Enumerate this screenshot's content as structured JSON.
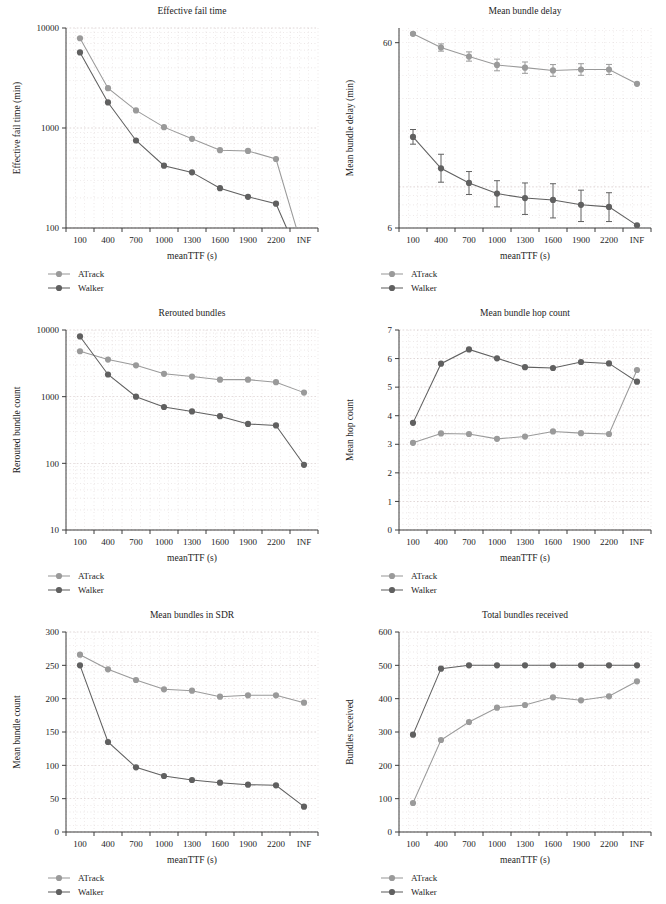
{
  "figure": {
    "background": "#ffffff",
    "columns": 2,
    "rows": 3
  },
  "style": {
    "color_atrack": "#9a9a9a",
    "color_walker": "#606060",
    "color_axis": "#3d3d3d",
    "color_grid": "#c9b8b8",
    "color_text": "#1d1d1d"
  },
  "legend": {
    "entries": [
      {
        "label": "ATrack",
        "color": "#9a9a9a",
        "marker": "filled-circle"
      },
      {
        "label": "Walker",
        "color": "#606060",
        "marker": "filled-circle"
      }
    ]
  },
  "shared": {
    "xlabel": "meanTTF (s)",
    "xticklabels": [
      "100",
      "400",
      "700",
      "1000",
      "1300",
      "1600",
      "1900",
      "2200",
      "INF"
    ]
  },
  "chart_data": [
    {
      "id": "effective-fail-time",
      "type": "line",
      "title": "Effective fail time",
      "xlabel": "meanTTF (s)",
      "ylabel": "Effective fail time (min)",
      "categories": [
        "100",
        "400",
        "700",
        "1000",
        "1300",
        "1600",
        "1900",
        "2200",
        "INF"
      ],
      "yscale": "log",
      "ylim": [
        100,
        10000
      ],
      "yticklabels": [
        "100",
        "1000",
        "10000"
      ],
      "ytickvalues": [
        100,
        1000,
        10000
      ],
      "grid": true,
      "legend_position": "below-left",
      "series": [
        {
          "name": "ATrack",
          "color": "#9a9a9a",
          "values": [
            7900,
            2500,
            1500,
            1020,
            780,
            600,
            590,
            490,
            55
          ]
        },
        {
          "name": "Walker",
          "color": "#606060",
          "values": [
            5700,
            1800,
            750,
            420,
            360,
            250,
            205,
            175,
            40
          ]
        }
      ],
      "notes": "Both series fall below the plotted 100 minimum at INF, so the final segments run off the bottom of the axes."
    },
    {
      "id": "mean-bundle-delay",
      "type": "line",
      "title": "Mean bundle delay",
      "xlabel": "meanTTF (s)",
      "ylabel": "Mean bundle delay (min)",
      "categories": [
        "100",
        "400",
        "700",
        "1000",
        "1300",
        "1600",
        "1900",
        "2200",
        "INF"
      ],
      "yscale": "log",
      "ylim": [
        6,
        72
      ],
      "yticklabels": [
        "6",
        "60"
      ],
      "ytickvalues": [
        6,
        60
      ],
      "grid": true,
      "legend_position": "below-left",
      "errorbars": true,
      "series": [
        {
          "name": "ATrack",
          "color": "#9a9a9a",
          "values": [
            67.0,
            56.5,
            50.5,
            45.5,
            44.0,
            42.5,
            43.0,
            43.0,
            36.0
          ],
          "err_low": [
            1.0,
            2.5,
            2.8,
            3.2,
            3.0,
            3.0,
            3.0,
            2.6,
            0.0
          ],
          "err_high": [
            1.0,
            2.6,
            3.0,
            3.4,
            3.2,
            3.2,
            3.2,
            2.8,
            0.0
          ]
        },
        {
          "name": "Walker",
          "color": "#606060",
          "values": [
            18.6,
            12.6,
            10.5,
            9.2,
            8.7,
            8.5,
            8.0,
            7.8,
            6.2
          ],
          "err_low": [
            1.6,
            2.0,
            1.4,
            1.4,
            1.6,
            1.7,
            1.5,
            1.3,
            0.0
          ],
          "err_high": [
            1.8,
            2.4,
            1.6,
            1.6,
            1.8,
            1.9,
            1.6,
            1.5,
            0.0
          ]
        }
      ]
    },
    {
      "id": "rerouted-bundles",
      "type": "line",
      "title": "Rerouted bundles",
      "xlabel": "meanTTF (s)",
      "ylabel": "Rerouted bundle count",
      "categories": [
        "100",
        "400",
        "700",
        "1000",
        "1300",
        "1600",
        "1900",
        "2200",
        "INF"
      ],
      "yscale": "log",
      "ylim": [
        10,
        10000
      ],
      "yticklabels": [
        "10",
        "100",
        "1000",
        "10000"
      ],
      "ytickvalues": [
        10,
        100,
        1000,
        10000
      ],
      "grid": true,
      "legend_position": "below-left",
      "series": [
        {
          "name": "ATrack",
          "color": "#9a9a9a",
          "values": [
            4800,
            3600,
            2950,
            2200,
            2000,
            1800,
            1800,
            1650,
            1150
          ]
        },
        {
          "name": "Walker",
          "color": "#606060",
          "values": [
            8000,
            2150,
            1000,
            700,
            600,
            510,
            390,
            370,
            95
          ]
        }
      ]
    },
    {
      "id": "mean-bundle-hop-count",
      "type": "line",
      "title": "Mean bundle hop count",
      "xlabel": "meanTTF (s)",
      "ylabel": "Mean hop count",
      "categories": [
        "100",
        "400",
        "700",
        "1000",
        "1300",
        "1600",
        "1900",
        "2200",
        "INF"
      ],
      "yscale": "linear",
      "ylim": [
        0,
        7
      ],
      "yticklabels": [
        "0",
        "1",
        "2",
        "3",
        "4",
        "5",
        "6",
        "7"
      ],
      "ytickvalues": [
        0,
        1,
        2,
        3,
        4,
        5,
        6,
        7
      ],
      "grid": true,
      "legend_position": "below-left",
      "series": [
        {
          "name": "ATrack",
          "color": "#9a9a9a",
          "values": [
            3.05,
            3.38,
            3.36,
            3.19,
            3.27,
            3.45,
            3.39,
            3.36,
            5.6
          ]
        },
        {
          "name": "Walker",
          "color": "#606060",
          "values": [
            3.75,
            5.82,
            6.32,
            6.01,
            5.7,
            5.67,
            5.88,
            5.83,
            5.19
          ]
        }
      ]
    },
    {
      "id": "mean-bundles-in-sdr",
      "type": "line",
      "title": "Mean bundles in SDR",
      "xlabel": "meanTTF (s)",
      "ylabel": "Mean bundle count",
      "categories": [
        "100",
        "400",
        "700",
        "1000",
        "1300",
        "1600",
        "1900",
        "2200",
        "INF"
      ],
      "yscale": "linear",
      "ylim": [
        0,
        300
      ],
      "yticklabels": [
        "0",
        "50",
        "100",
        "150",
        "200",
        "250",
        "300"
      ],
      "ytickvalues": [
        0,
        50,
        100,
        150,
        200,
        250,
        300
      ],
      "grid": true,
      "legend_position": "below-left",
      "series": [
        {
          "name": "ATrack",
          "color": "#9a9a9a",
          "values": [
            266,
            244,
            228,
            214,
            212,
            203,
            205,
            205,
            194
          ]
        },
        {
          "name": "Walker",
          "color": "#606060",
          "values": [
            250,
            135,
            97,
            84,
            78,
            74,
            71,
            70,
            38
          ]
        }
      ]
    },
    {
      "id": "total-bundles-received",
      "type": "line",
      "title": "Total bundles received",
      "xlabel": "meanTTF (s)",
      "ylabel": "Bundles received",
      "categories": [
        "100",
        "400",
        "700",
        "1000",
        "1300",
        "1600",
        "1900",
        "2200",
        "INF"
      ],
      "yscale": "linear",
      "ylim": [
        0,
        600
      ],
      "yticklabels": [
        "0",
        "100",
        "200",
        "300",
        "400",
        "500",
        "600"
      ],
      "ytickvalues": [
        0,
        100,
        200,
        300,
        400,
        500,
        600
      ],
      "grid": true,
      "legend_position": "below-left",
      "series": [
        {
          "name": "ATrack",
          "color": "#9a9a9a",
          "values": [
            87,
            276,
            330,
            373,
            381,
            404,
            395,
            407,
            452
          ]
        },
        {
          "name": "Walker",
          "color": "#606060",
          "values": [
            292,
            490,
            500,
            500,
            500,
            500,
            500,
            500,
            500
          ]
        }
      ]
    }
  ]
}
